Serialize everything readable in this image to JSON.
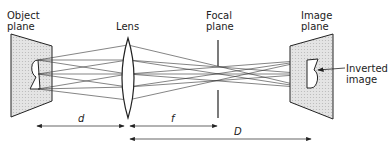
{
  "labels": {
    "object_plane": "Object\nplane",
    "lens": "Lens",
    "focal_plane": "Focal\nplane",
    "image_plane": "Image\nplane",
    "inverted_image": "Inverted\nimage",
    "dim_d": "d",
    "dim_f": "f",
    "dim_D": "D"
  },
  "colors": {
    "line": "#222222",
    "plane_fill": "#dcdcdc"
  }
}
